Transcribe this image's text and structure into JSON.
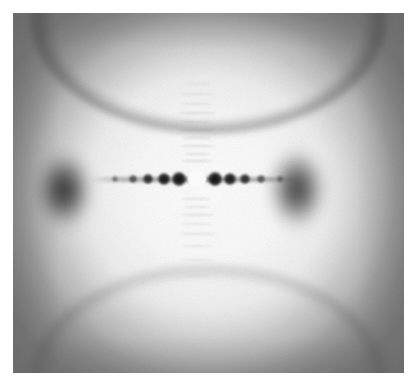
{
  "image": {
    "kind": "xray-fiber-diffraction-photograph",
    "caption": "",
    "frame": {
      "plate_left": 13,
      "plate_top": 13,
      "plate_width": 391,
      "plate_height": 360,
      "margin_color": "#ffffff",
      "plate_base_color": "#d8d8d8"
    },
    "colors": {
      "background": "#ffffff",
      "film_light": "#f2f2f2",
      "film_mid": "#bdbdbd",
      "film_dark": "#4a4a4a",
      "spot_dark": "#0a0a0a",
      "beamstop_white": "#ffffff"
    }
  },
  "pattern": {
    "center": {
      "x": 197,
      "y": 179
    },
    "beamstop": {
      "label": "beam-stop",
      "diameter": 18
    },
    "equator_streak": {
      "label": "equatorial-streak",
      "y": 179,
      "half_length": 106
    },
    "lobes": [
      {
        "name": "lobe-left",
        "cx": 51,
        "cy": 177,
        "rx": 31,
        "ry": 42,
        "darkness": 0.88
      },
      {
        "name": "lobe-right",
        "cx": 284,
        "cy": 176,
        "rx": 31,
        "ry": 43,
        "darkness": 0.84
      }
    ],
    "equatorial_spots": [
      {
        "dx": -82,
        "dy": 0,
        "r": 3.0,
        "intensity": 0.45
      },
      {
        "dx": -64,
        "dy": 0,
        "r": 4.0,
        "intensity": 0.62
      },
      {
        "dx": -49,
        "dy": 0,
        "r": 5.2,
        "intensity": 0.86
      },
      {
        "dx": -33,
        "dy": 0,
        "r": 6.4,
        "intensity": 0.96
      },
      {
        "dx": -18,
        "dy": 0,
        "r": 7.0,
        "intensity": 1.0
      },
      {
        "dx": 18,
        "dy": 0,
        "r": 7.0,
        "intensity": 1.0
      },
      {
        "dx": 33,
        "dy": 0,
        "r": 6.2,
        "intensity": 0.94
      },
      {
        "dx": 48,
        "dy": 0,
        "r": 5.0,
        "intensity": 0.84
      },
      {
        "dx": 64,
        "dy": 0,
        "r": 4.0,
        "intensity": 0.6
      },
      {
        "dx": 83,
        "dy": 0,
        "r": 3.0,
        "intensity": 0.42
      }
    ],
    "layer_lines": [
      {
        "dy": -96,
        "width": 26,
        "height": 2.0,
        "opacity": 0.16
      },
      {
        "dy": -86,
        "width": 34,
        "height": 2.2,
        "opacity": 0.2
      },
      {
        "dy": -76,
        "width": 30,
        "height": 2.0,
        "opacity": 0.22
      },
      {
        "dy": -67,
        "width": 38,
        "height": 2.4,
        "opacity": 0.3
      },
      {
        "dy": -58,
        "width": 30,
        "height": 2.0,
        "opacity": 0.26
      },
      {
        "dy": -50,
        "width": 36,
        "height": 2.4,
        "opacity": 0.3
      },
      {
        "dy": -42,
        "width": 28,
        "height": 2.0,
        "opacity": 0.26
      },
      {
        "dy": -34,
        "width": 34,
        "height": 2.4,
        "opacity": 0.34
      },
      {
        "dy": -26,
        "width": 26,
        "height": 2.2,
        "opacity": 0.3
      },
      {
        "dy": -19,
        "width": 32,
        "height": 2.4,
        "opacity": 0.34
      },
      {
        "dy": 19,
        "width": 30,
        "height": 2.4,
        "opacity": 0.3
      },
      {
        "dy": 27,
        "width": 26,
        "height": 2.2,
        "opacity": 0.26
      },
      {
        "dy": 35,
        "width": 34,
        "height": 2.4,
        "opacity": 0.3
      },
      {
        "dy": 44,
        "width": 30,
        "height": 2.2,
        "opacity": 0.24
      },
      {
        "dy": 54,
        "width": 36,
        "height": 2.4,
        "opacity": 0.26
      },
      {
        "dy": 66,
        "width": 30,
        "height": 2.2,
        "opacity": 0.22
      },
      {
        "dy": 80,
        "width": 34,
        "height": 2.2,
        "opacity": 0.2
      },
      {
        "dy": 96,
        "width": 26,
        "height": 2.0,
        "opacity": 0.15
      }
    ],
    "arcs": [
      {
        "name": "arc-top",
        "position": "top",
        "darkness": 0.4
      },
      {
        "name": "arc-bottom",
        "position": "bottom",
        "darkness": 0.26
      }
    ]
  }
}
